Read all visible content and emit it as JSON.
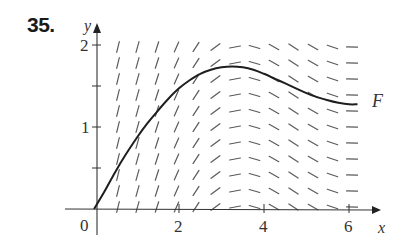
{
  "problem_number": "35.",
  "chart_data": {
    "type": "line",
    "title": "",
    "subtitle": "slope field with solution curve F",
    "xlabel": "x",
    "ylabel": "y",
    "xlim": [
      0,
      6.5
    ],
    "ylim": [
      0,
      2.1
    ],
    "x_ticks": [
      2,
      4,
      6
    ],
    "x_tick_labels": [
      "2",
      "4",
      "6"
    ],
    "y_ticks": [
      1,
      2
    ],
    "y_tick_labels": [
      "1",
      "2"
    ],
    "y_minor_ticks": [
      0.5,
      1.5
    ],
    "origin_label": "0",
    "grid": false,
    "legend": "none",
    "annotations": [
      {
        "text": "F",
        "x": 6.4,
        "y": 1.32
      }
    ],
    "slope_field": {
      "x_positions": [
        0.5,
        0.96,
        1.42,
        1.88,
        2.33,
        2.79,
        3.25,
        3.71,
        4.17,
        4.63,
        5.08,
        5.54,
        6.0
      ],
      "y_positions": [
        0.0,
        0.2,
        0.4,
        0.6,
        0.8,
        1.0,
        1.2,
        1.4,
        1.6,
        1.8,
        2.0
      ],
      "slopes_by_column": [
        2.1,
        1.9,
        1.6,
        1.2,
        0.8,
        0.4,
        0.1,
        -0.15,
        -0.3,
        -0.35,
        -0.3,
        -0.18,
        -0.02
      ]
    },
    "series": [
      {
        "name": "F",
        "x": [
          0.0,
          0.25,
          0.5,
          0.75,
          1.0,
          1.25,
          1.5,
          1.75,
          2.0,
          2.25,
          2.5,
          2.75,
          3.0,
          3.25,
          3.5,
          3.75,
          4.0,
          4.25,
          4.5,
          4.75,
          5.0,
          5.25,
          5.5,
          5.75,
          6.0,
          6.2
        ],
        "values": [
          0.0,
          0.22,
          0.46,
          0.68,
          0.88,
          1.06,
          1.22,
          1.37,
          1.5,
          1.6,
          1.68,
          1.73,
          1.76,
          1.77,
          1.76,
          1.73,
          1.68,
          1.62,
          1.56,
          1.5,
          1.44,
          1.39,
          1.35,
          1.32,
          1.3,
          1.3
        ]
      }
    ]
  }
}
